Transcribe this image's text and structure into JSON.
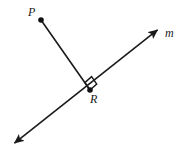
{
  "figure": {
    "type": "geometry-diagram",
    "background_color": "#ffffff",
    "stroke_color": "#1a1a1a",
    "stroke_width": 1.6,
    "width": 184,
    "height": 158,
    "labels": {
      "point_p": "P",
      "point_r": "R",
      "line_m": "m"
    },
    "points": [
      {
        "name": "P",
        "x": 41,
        "y": 20,
        "radius": 2.8,
        "filled": true
      },
      {
        "name": "R",
        "x": 90,
        "y": 90,
        "radius": 2.8,
        "filled": true
      }
    ],
    "line_m": {
      "name": "m",
      "arrow_start": {
        "x": 12,
        "y": 145
      },
      "arrow_end": {
        "x": 160,
        "y": 28
      },
      "double_headed": true
    },
    "segment_pr": {
      "name": "PR",
      "from": {
        "x": 41,
        "y": 20
      },
      "to": {
        "x": 90,
        "y": 90
      }
    },
    "right_angle_marker": {
      "name": "right-angle",
      "vertex": {
        "x": 90,
        "y": 90
      },
      "size": 9,
      "shown": true
    }
  }
}
